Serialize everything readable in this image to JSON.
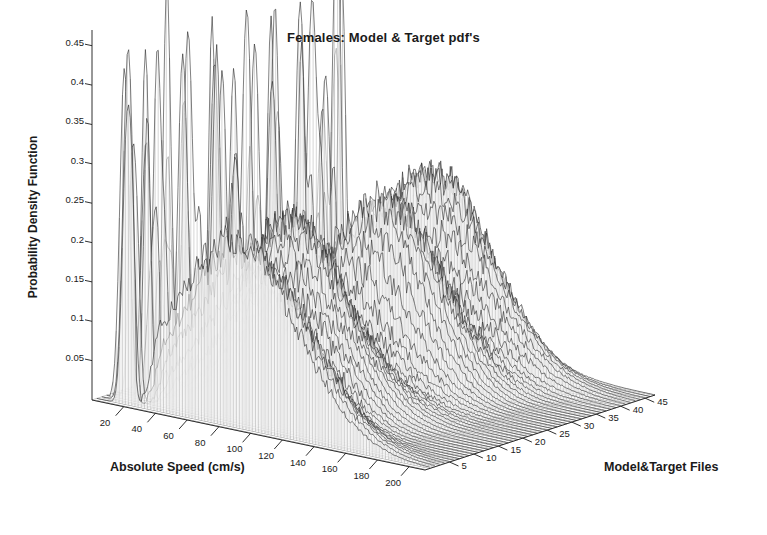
{
  "chart_data": {
    "type": "line",
    "subtype": "3d-waterfall-mesh",
    "title": "Females: Model & Target pdf's",
    "xlabel": "Absolute Speed (cm/s)",
    "ylabel": "Probability Density Function",
    "zlabel": "Model&Target Files",
    "grid": false,
    "legend": "none",
    "background_color": "#ffffff",
    "line_color": "#2b2b2b",
    "text_color": "#1a1a1a",
    "xlim": [
      0,
      210
    ],
    "ylim": [
      0,
      0.47
    ],
    "zlim": [
      0,
      47
    ],
    "x_ticks": [
      20,
      40,
      60,
      80,
      100,
      120,
      140,
      160,
      180,
      200
    ],
    "y_ticks": [
      0.05,
      0.1,
      0.15,
      0.2,
      0.25,
      0.3,
      0.35,
      0.4,
      0.45
    ],
    "y_tick_labels": [
      "0.05",
      "0.1",
      "0.15",
      "0.2",
      "0.25",
      "0.3",
      "0.35",
      "0.4",
      "0.45"
    ],
    "z_ticks": [
      5,
      10,
      15,
      20,
      25,
      30,
      35,
      40,
      45
    ],
    "series_count": 47,
    "series_note": "Each trace is one model/target file's speed probability density function plotted as a waterfall ridge along the Model&Target Files axis.",
    "profile_description": "Each pdf shows a very tall narrow mode near 10-25 cm/s reaching up to 0.45, a deep trough near 30 cm/s, then a broad noisy mound peaking around 0.22 near 70-100 cm/s that decays toward 200 cm/s.",
    "peak_near_origin_max": 0.45,
    "broad_mound_peak": 0.23,
    "broad_mound_center_speed": 85,
    "noise_amplitude": 0.035,
    "front_series_index": 1,
    "back_series_index": 47
  },
  "axes": {
    "x_tick_labels": [
      "20",
      "40",
      "60",
      "80",
      "100",
      "120",
      "140",
      "160",
      "180",
      "200"
    ],
    "z_tick_labels": [
      "5",
      "10",
      "15",
      "20",
      "25",
      "30",
      "35",
      "40",
      "45"
    ]
  }
}
